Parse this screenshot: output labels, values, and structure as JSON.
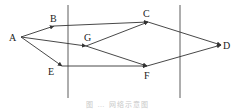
{
  "diagram": {
    "type": "network-flow",
    "nodes": [
      {
        "id": "A",
        "label": "A",
        "x": 21,
        "y": 37,
        "lx": 9,
        "ly": 41
      },
      {
        "id": "B",
        "label": "B",
        "x": 54,
        "y": 26,
        "lx": 50,
        "ly": 22
      },
      {
        "id": "C",
        "label": "C",
        "x": 148,
        "y": 22,
        "lx": 143,
        "ly": 17
      },
      {
        "id": "G",
        "label": "G",
        "x": 86,
        "y": 46,
        "lx": 84,
        "ly": 41
      },
      {
        "id": "E",
        "label": "E",
        "x": 62,
        "y": 66,
        "lx": 48,
        "ly": 75
      },
      {
        "id": "F",
        "label": "F",
        "x": 147,
        "y": 66,
        "lx": 144,
        "ly": 79
      },
      {
        "id": "D",
        "label": "D",
        "x": 221,
        "y": 45,
        "lx": 223,
        "ly": 49
      }
    ],
    "edges": [
      {
        "from": "A",
        "to": "B"
      },
      {
        "from": "A",
        "to": "G"
      },
      {
        "from": "A",
        "to": "E"
      },
      {
        "from": "B",
        "to": "C"
      },
      {
        "from": "G",
        "to": "C"
      },
      {
        "from": "G",
        "to": "F"
      },
      {
        "from": "E",
        "to": "F"
      },
      {
        "from": "C",
        "to": "D"
      },
      {
        "from": "F",
        "to": "D"
      }
    ],
    "dividers": [
      {
        "x": 68,
        "y1": 5,
        "y2": 98
      },
      {
        "x": 180,
        "y1": 5,
        "y2": 98
      }
    ],
    "caption": "图 … 网络示意图",
    "colors": {
      "line": "#333333",
      "label": "#222222",
      "caption": "#c8c8c8"
    }
  }
}
